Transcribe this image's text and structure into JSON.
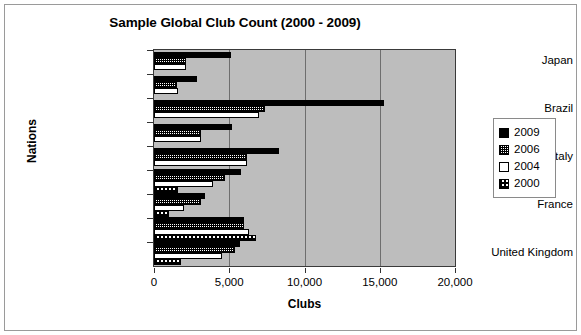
{
  "chart_data": {
    "type": "bar",
    "orientation": "horizontal",
    "title": "Sample Global Club Count (2000 - 2009)",
    "xlabel": "Clubs",
    "ylabel": "Nations",
    "xlim": [
      0,
      20000
    ],
    "xticks": [
      0,
      5000,
      10000,
      15000,
      20000
    ],
    "xtick_labels": [
      "0",
      "5,000",
      "10,000",
      "15,000",
      "20,000"
    ],
    "grid": true,
    "legend_position": "right",
    "plot_background": "#bdbdbd",
    "categories": [
      "Japan",
      "",
      "Brazil",
      "",
      "Italy",
      "",
      "France",
      "",
      "United Kingdom"
    ],
    "series": [
      {
        "name": "2009",
        "color": "#000000",
        "pattern": "solid",
        "values": [
          5100,
          2850,
          15300,
          5200,
          8300,
          5800,
          3400,
          6000,
          5700
        ]
      },
      {
        "name": "2006",
        "color": "#ffffff",
        "pattern": "fine-dots",
        "values": [
          2100,
          1500,
          7400,
          3150,
          6200,
          4700,
          3100,
          6000,
          5400
        ]
      },
      {
        "name": "2004",
        "color": "#ffffff",
        "pattern": "none",
        "values": [
          2100,
          1600,
          7000,
          3150,
          6200,
          3900,
          2000,
          6300,
          4500
        ]
      },
      {
        "name": "2000",
        "color": "#ffffff",
        "pattern": "checker",
        "values": [
          null,
          null,
          null,
          null,
          null,
          1600,
          1000,
          6800,
          1800
        ]
      }
    ]
  },
  "legend": {
    "items": [
      {
        "label": "2009",
        "pattern": "solid"
      },
      {
        "label": "2006",
        "pattern": "fine-dots"
      },
      {
        "label": "2004",
        "pattern": "none"
      },
      {
        "label": "2000",
        "pattern": "checker"
      }
    ]
  }
}
